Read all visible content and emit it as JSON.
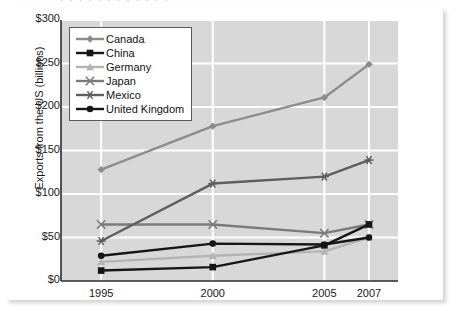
{
  "figure": {
    "top_cropped_text": "· · · · · · · · · · · ·",
    "background_color": "#d8d8d8",
    "gridline_color": "#ffffff",
    "card_color": "#ffffff"
  },
  "chart_data": {
    "type": "line",
    "title": "",
    "xlabel": "",
    "ylabel": "Exports from the US (billions)",
    "x": [
      1995,
      2000,
      2005,
      2007
    ],
    "categories": [
      "1995",
      "2000",
      "2005",
      "2007"
    ],
    "xlim": [
      1993.2,
      2008.3
    ],
    "ylim": [
      0,
      300
    ],
    "ytick_values": [
      0,
      50,
      100,
      150,
      200,
      250,
      300
    ],
    "ytick_labels": [
      "$0",
      "$50",
      "$100",
      "$150",
      "$200",
      "$250",
      "$300"
    ],
    "grid": "horizontal-and-vertical",
    "legend_position": "upper-left-inside",
    "series": [
      {
        "name": "Canada",
        "marker": "diamond",
        "color": "#8c8c8c",
        "values": [
          128,
          178,
          211,
          249
        ]
      },
      {
        "name": "China",
        "marker": "square",
        "color": "#161616",
        "values": [
          12,
          16,
          41,
          65
        ]
      },
      {
        "name": "Germany",
        "marker": "triangle",
        "color": "#b4b4b4",
        "values": [
          22,
          29,
          34,
          50
        ]
      },
      {
        "name": "Japan",
        "marker": "x",
        "color": "#7a7a7a",
        "values": [
          65,
          65,
          55,
          65
        ]
      },
      {
        "name": "Mexico",
        "marker": "asterisk",
        "color": "#5e5e5e",
        "values": [
          46,
          112,
          120,
          139
        ]
      },
      {
        "name": "United Kingdom",
        "marker": "circle",
        "color": "#161616",
        "values": [
          29,
          43,
          42,
          50
        ]
      }
    ]
  }
}
